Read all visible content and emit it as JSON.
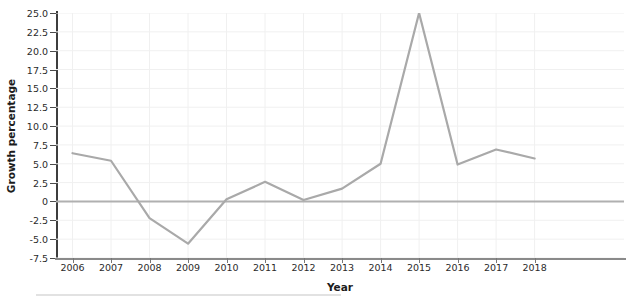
{
  "chart_data": {
    "type": "line",
    "title": "",
    "xlabel": "Year",
    "ylabel": "Growth percentage",
    "categories": [
      "2006",
      "2007",
      "2008",
      "2009",
      "2010",
      "2011",
      "2012",
      "2013",
      "2014",
      "2015",
      "2016",
      "2017",
      "2018"
    ],
    "values": [
      6.4,
      5.4,
      -2.2,
      -5.6,
      0.3,
      2.6,
      0.2,
      1.7,
      5.0,
      25.0,
      4.9,
      6.9,
      5.7
    ],
    "series": [
      {
        "name": "Growth percentage",
        "values": [
          6.4,
          5.4,
          -2.2,
          -5.6,
          0.3,
          2.6,
          0.2,
          1.7,
          5.0,
          25.0,
          4.9,
          6.9,
          5.7
        ],
        "color": "#a9a9a9"
      }
    ],
    "ylim": [
      -7.5,
      25.0
    ],
    "ytick_labels": [
      "25.0",
      "22.5",
      "20.0",
      "17.5",
      "15.0",
      "12.5",
      "10.0",
      "7.5",
      "5.0",
      "2.5",
      "0",
      "-2.5",
      "-5.0",
      "-7.5"
    ],
    "ytick_values": [
      25.0,
      22.5,
      20.0,
      17.5,
      15.0,
      12.5,
      10.0,
      7.5,
      5.0,
      2.5,
      0,
      -2.5,
      -5.0,
      -7.5
    ],
    "xtick_labels": [
      "2006",
      "2007",
      "2008",
      "2009",
      "2010",
      "2011",
      "2012",
      "2013",
      "2014",
      "2015",
      "2016",
      "2017",
      "2018"
    ],
    "grid": true,
    "grid_color": "#f0f0f0",
    "legend": "none",
    "zero_line": true,
    "zero_line_color": "#b0b0b0",
    "background_color": "#ffffff",
    "line_color": "#a9a9a9",
    "line_width": 2.2,
    "markers": "none"
  }
}
